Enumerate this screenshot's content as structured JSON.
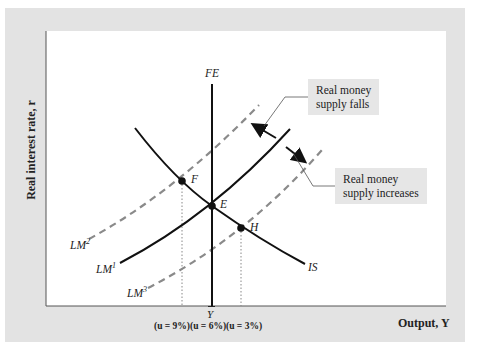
{
  "axes": {
    "y_label": "Real interest rate, r",
    "x_label": "Output, Y",
    "x_tick": "Ȳ"
  },
  "curves": {
    "FE": "FE",
    "IS": "IS",
    "LM1": "LM",
    "LM1_sup": "1",
    "LM2": "LM",
    "LM2_sup": "2",
    "LM3": "LM",
    "LM3_sup": "3"
  },
  "points": {
    "E": "E",
    "F": "F",
    "H": "H"
  },
  "annotations": {
    "falls_line1": "Real money",
    "falls_line2": "supply falls",
    "increases_line1": "Real money",
    "increases_line2": "supply increases"
  },
  "unemployment": "(u = 9%)(u = 6%)(u = 3%)",
  "colors": {
    "panel": "#e3e3e3",
    "curve": "#111111",
    "dashed": "#8a8a8a",
    "note_bg": "#e6e6e6"
  }
}
